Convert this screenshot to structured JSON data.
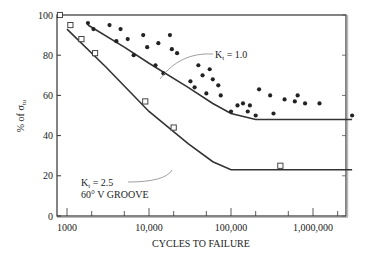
{
  "chart_data": {
    "type": "scatter",
    "title": "",
    "xlabel": "CYCLES TO FAILURE",
    "ylabel": "% of σ_tu",
    "ylabel_main": "% of σ",
    "ylabel_sub": "tu",
    "x_scale": "log",
    "xlim": [
      800,
      3000000
    ],
    "ylim": [
      0,
      100
    ],
    "x_ticks": [
      1000,
      10000,
      100000,
      1000000
    ],
    "x_tick_labels": [
      "1000",
      "10,000",
      "100,000",
      "1,000,000"
    ],
    "y_ticks": [
      0,
      20,
      40,
      60,
      80,
      100
    ],
    "y_tick_labels": [
      "0",
      "20",
      "40",
      "60",
      "80",
      "100"
    ],
    "grid": false,
    "series": [
      {
        "name": "Kt = 1.0 (unnotched) test data",
        "marker": "filled-circle",
        "points": [
          [
            1800,
            96
          ],
          [
            2100,
            93
          ],
          [
            3300,
            95
          ],
          [
            4500,
            93
          ],
          [
            4000,
            87
          ],
          [
            5500,
            88
          ],
          [
            6500,
            80
          ],
          [
            8500,
            90
          ],
          [
            9500,
            84
          ],
          [
            12000,
            75
          ],
          [
            13000,
            86
          ],
          [
            15000,
            71
          ],
          [
            18000,
            90
          ],
          [
            19000,
            83
          ],
          [
            22000,
            81
          ],
          [
            32000,
            67
          ],
          [
            36000,
            64
          ],
          [
            40000,
            75
          ],
          [
            45000,
            70
          ],
          [
            50000,
            61
          ],
          [
            55000,
            73
          ],
          [
            60000,
            68
          ],
          [
            70000,
            65
          ],
          [
            75000,
            60
          ],
          [
            100000,
            52
          ],
          [
            120000,
            55
          ],
          [
            140000,
            56
          ],
          [
            160000,
            52
          ],
          [
            170000,
            55
          ],
          [
            200000,
            50
          ],
          [
            220000,
            63
          ],
          [
            300000,
            60
          ],
          [
            330000,
            51
          ],
          [
            450000,
            58
          ],
          [
            600000,
            57
          ],
          [
            650000,
            60
          ],
          [
            800000,
            56
          ],
          [
            1200000,
            56
          ],
          [
            3000000,
            50
          ]
        ]
      },
      {
        "name": "Kt = 2.5 60° V groove test data",
        "marker": "open-square",
        "points": [
          [
            820,
            100
          ],
          [
            1100,
            95
          ],
          [
            1500,
            88
          ],
          [
            2200,
            81
          ],
          [
            9000,
            57
          ],
          [
            20000,
            44
          ],
          [
            400000,
            25
          ]
        ]
      },
      {
        "name": "Kt = 1.0 curve",
        "type": "line",
        "points": [
          [
            1800,
            95
          ],
          [
            5000,
            84
          ],
          [
            10000,
            76
          ],
          [
            30000,
            64
          ],
          [
            60000,
            56
          ],
          [
            100000,
            51
          ],
          [
            200000,
            48
          ],
          [
            1000000,
            48
          ],
          [
            3000000,
            48
          ]
        ]
      },
      {
        "name": "Kt = 2.5 curve",
        "type": "line",
        "points": [
          [
            1000,
            93
          ],
          [
            3000,
            74
          ],
          [
            10000,
            52
          ],
          [
            30000,
            36
          ],
          [
            60000,
            27
          ],
          [
            100000,
            23
          ],
          [
            200000,
            23
          ],
          [
            1000000,
            23
          ],
          [
            3000000,
            23
          ]
        ]
      }
    ],
    "annotations": [
      {
        "text": "Kt = 1.0",
        "main": "K",
        "sub": "t",
        "rest": " = 1.0",
        "x": 100000,
        "y": 82
      },
      {
        "text": "Kt = 2.5",
        "main": "K",
        "sub": "t",
        "rest": " = 2.5",
        "x": 1700,
        "y": 31
      },
      {
        "text": "60° V GROOVE",
        "x": 1700,
        "y": 25
      }
    ]
  }
}
